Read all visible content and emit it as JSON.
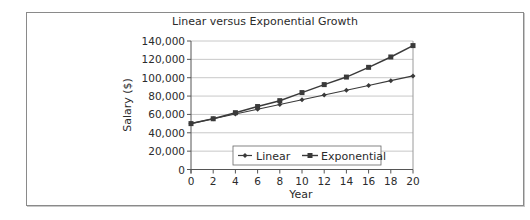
{
  "chart_data": {
    "type": "line",
    "title": "Linear versus Exponential Growth",
    "xlabel": "Year",
    "ylabel": "Salary ($)",
    "x": [
      0,
      2,
      4,
      6,
      8,
      10,
      12,
      14,
      16,
      18,
      20
    ],
    "series": [
      {
        "name": "Linear",
        "marker": "diamond",
        "values": [
          50000,
          55200,
          60400,
          65600,
          70800,
          76000,
          81200,
          86400,
          91600,
          96800,
          102000
        ]
      },
      {
        "name": "Exponential",
        "marker": "square",
        "values": [
          50000,
          55300,
          61900,
          68600,
          75000,
          83800,
          92500,
          100700,
          111300,
          122600,
          135000
        ]
      }
    ],
    "xlim": [
      0,
      20
    ],
    "ylim": [
      0,
      140000
    ],
    "xticks": [
      "0",
      "2",
      "4",
      "6",
      "8",
      "10",
      "12",
      "14",
      "16",
      "18",
      "20"
    ],
    "yticks": [
      "0",
      "20,000",
      "40,000",
      "60,000",
      "80,000",
      "100,000",
      "120,000",
      "140,000"
    ],
    "grid": true,
    "legend_position": "lower-center-inside",
    "colors": {
      "line": "#3a3a3a",
      "grid": "#c8c8c8",
      "axis": "#555555",
      "frame": "#8a8a8a"
    }
  }
}
